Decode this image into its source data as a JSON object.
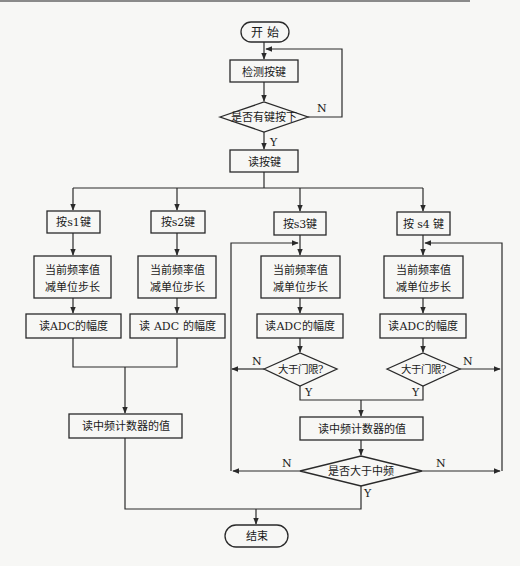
{
  "diagram": {
    "type": "flowchart",
    "nodes": {
      "start": "开  始",
      "detect_key": "检测按键",
      "key_pressed": "是否有键按下",
      "read_key": "读按键",
      "s1_key": "按s1键",
      "s2_key": "按s2键",
      "s3_key": "按s3键",
      "s4_key": "按 s4 键",
      "s1_freq_line1": "当前频率值",
      "s1_freq_line2": "减单位步长",
      "s2_freq_line1": "当前频率值",
      "s2_freq_line2": "减单位步长",
      "s3_freq_line1": "当前频率值",
      "s3_freq_line2": "减单位步长",
      "s4_freq_line1": "当前频率值",
      "s4_freq_line2": "减单位步长",
      "s1_adc": "读ADC的幅度",
      "s2_adc": "读 ADC 的幅度",
      "s3_adc": "读ADC的幅度",
      "s4_adc": "读ADC的幅度",
      "s3_threshold": "大于门限?",
      "s4_threshold": "大于门限?",
      "left_counter": "读中频计数器的值",
      "right_counter": "读中频计数器的值",
      "above_if": "是否大于中频",
      "end": "结束"
    },
    "labels": {
      "yes": "Y",
      "no": "N"
    }
  }
}
